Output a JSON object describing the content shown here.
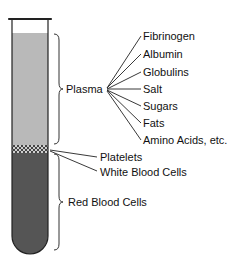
{
  "diagram": {
    "title": "",
    "components": {
      "plasma": {
        "label": "Plasma",
        "constituents": [
          "Fibrinogen",
          "Albumin",
          "Globulins",
          "Salt",
          "Sugars",
          "Fats",
          "Amino Acids, etc."
        ]
      },
      "buffy_coat": {
        "labels": [
          "Platelets",
          "White Blood Cells"
        ]
      },
      "red_cells": {
        "label": "Red Blood Cells"
      }
    },
    "colors": {
      "plasma": "#b8b8b8",
      "buffy": "#8a8a8a",
      "red_cells": "#5a5a5a",
      "outline": "#222222"
    }
  }
}
